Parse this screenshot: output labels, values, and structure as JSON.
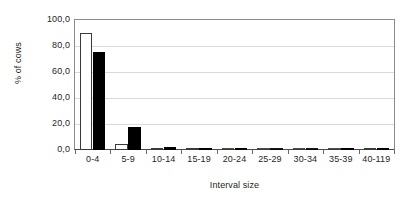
{
  "chart_data": {
    "type": "bar",
    "title": "",
    "subtitle": "",
    "xlabel": "Interval size",
    "ylabel": "% of cows",
    "categories": [
      "0-4",
      "5-9",
      "10-14",
      "15-19",
      "20-24",
      "25-29",
      "30-34",
      "35-39",
      "40-119"
    ],
    "series": [
      {
        "name": "open",
        "style": "white-filled-black-outline",
        "values": [
          90.0,
          5.0,
          1.0,
          0.3,
          0.0,
          0.0,
          0.0,
          0.0,
          1.2
        ]
      },
      {
        "name": "filled",
        "style": "solid-black",
        "values": [
          75.5,
          18.0,
          2.5,
          1.0,
          0.8,
          0.0,
          0.0,
          0.5,
          1.2
        ]
      }
    ],
    "ylim": [
      0,
      100
    ],
    "ytick_values": [
      0,
      20,
      40,
      60,
      80,
      100
    ],
    "ytick_labels": [
      "0,0",
      "20,0",
      "40,0",
      "60,0",
      "80,0",
      "100,0"
    ],
    "grid": true,
    "grid_axis": "y",
    "legend": "none",
    "legend_position": "none",
    "decimal_separator": ",",
    "colors": {
      "series_open": "#ffffff",
      "series_open_outline": "#3a3a3a",
      "series_filled": "#000000",
      "gridline": "#d9d9d9",
      "axis": "#8b8b8b",
      "text": "#231f20",
      "background": "#ffffff"
    }
  }
}
